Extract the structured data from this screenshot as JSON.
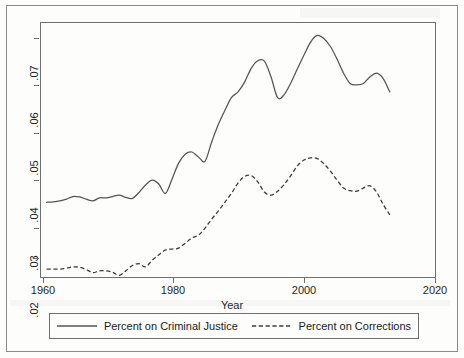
{
  "figure": {
    "x_axis_title": "Year",
    "y_axis_title": ""
  },
  "legend": {
    "entries": [
      {
        "label": "Percent on Criminal Justice",
        "style": "solid",
        "icon": "solid-line-icon"
      },
      {
        "label": "Percent on Corrections",
        "style": "dashed",
        "icon": "dashed-line-icon"
      }
    ]
  },
  "axes": {
    "x_ticks": [
      "1960",
      "1980",
      "2000",
      "2020"
    ],
    "y_ticks": [
      ".02",
      ".03",
      ".04",
      ".05",
      ".06",
      ".07"
    ]
  },
  "colors": {
    "criminal_justice_line": "#545454",
    "corrections_line": "#3d3d3d",
    "axis": "#6f6f6f",
    "frame": "#8a8a8a",
    "background": "#fdfdfb",
    "text": "#1a1a1a"
  },
  "chart_data": {
    "type": "line",
    "title": "",
    "xlabel": "Year",
    "ylabel": "",
    "xlim": [
      1960,
      2020
    ],
    "ylim": [
      0.018,
      0.0755
    ],
    "grid": false,
    "legend_position": "bottom",
    "x": [
      1961,
      1962,
      1963,
      1964,
      1965,
      1966,
      1967,
      1968,
      1969,
      1970,
      1971,
      1972,
      1973,
      1974,
      1975,
      1976,
      1977,
      1978,
      1979,
      1980,
      1981,
      1982,
      1983,
      1984,
      1985,
      1986,
      1987,
      1988,
      1989,
      1990,
      1991,
      1992,
      1993,
      1994,
      1995,
      1996,
      1997,
      1998,
      1999,
      2000,
      2001,
      2002,
      2003,
      2004,
      2005,
      2006,
      2007,
      2008,
      2009,
      2010,
      2011,
      2012,
      2013
    ],
    "series": [
      {
        "name": "Percent on Criminal Justice",
        "style": "solid",
        "values": [
          0.035,
          0.0351,
          0.0353,
          0.0357,
          0.0363,
          0.0362,
          0.0357,
          0.0353,
          0.036,
          0.036,
          0.0363,
          0.0366,
          0.0361,
          0.0359,
          0.0372,
          0.0389,
          0.04,
          0.0391,
          0.037,
          0.0402,
          0.0438,
          0.0458,
          0.0463,
          0.0452,
          0.0442,
          0.0485,
          0.0524,
          0.0556,
          0.0585,
          0.0598,
          0.062,
          0.0651,
          0.0668,
          0.0667,
          0.0632,
          0.0585,
          0.0592,
          0.0618,
          0.065,
          0.0681,
          0.071,
          0.0725,
          0.0718,
          0.07,
          0.0672,
          0.064,
          0.0617,
          0.0614,
          0.0617,
          0.0632,
          0.064,
          0.0628,
          0.0598
        ],
        "last_value_note": "series ends near 0.0535 in final year"
      },
      {
        "name": "Percent on Corrections",
        "style": "dashed",
        "values": [
          0.02,
          0.02,
          0.02,
          0.0202,
          0.0205,
          0.0204,
          0.0199,
          0.0192,
          0.0196,
          0.0196,
          0.0193,
          0.0186,
          0.0196,
          0.0208,
          0.0212,
          0.0205,
          0.022,
          0.0232,
          0.0243,
          0.0245,
          0.0247,
          0.0258,
          0.027,
          0.0276,
          0.0292,
          0.0312,
          0.033,
          0.035,
          0.037,
          0.0393,
          0.0408,
          0.041,
          0.0396,
          0.0373,
          0.0366,
          0.0375,
          0.039,
          0.041,
          0.0432,
          0.0445,
          0.045,
          0.0448,
          0.0437,
          0.042,
          0.04,
          0.0382,
          0.0376,
          0.0375,
          0.0382,
          0.0387,
          0.0373,
          0.0345,
          0.0322
        ],
        "last_value_note": "series ends near 0.0312 in final year"
      }
    ]
  }
}
